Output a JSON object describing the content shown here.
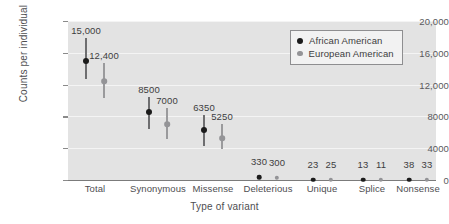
{
  "chart_data": {
    "type": "scatter",
    "title": "",
    "xlabel": "Type of variant",
    "ylabel": "Counts per individual",
    "ylim": [
      0,
      20000
    ],
    "yticks": [
      "0",
      "4000",
      "8000",
      "12,000",
      "16,000",
      "20,000"
    ],
    "ytick_values": [
      0,
      4000,
      8000,
      12000,
      16000,
      20000
    ],
    "grid": "horizontal",
    "legend_position": "top-right",
    "categories": [
      "Total",
      "Synonymous",
      "Missense",
      "Deleterious",
      "Unique",
      "Splice",
      "Nonsense"
    ],
    "series": [
      {
        "name": "African American",
        "color": "#1b1b1b",
        "values": [
          15000,
          8500,
          6350,
          330,
          23,
          13,
          38
        ],
        "labels": [
          "15,000",
          "8500",
          "6350",
          "330",
          "23",
          "13",
          "38"
        ],
        "err_low": [
          12700,
          6400,
          4300,
          120,
          5,
          3,
          10
        ],
        "err_high": [
          17800,
          10400,
          8200,
          600,
          45,
          25,
          70
        ]
      },
      {
        "name": "European American",
        "color": "#949497",
        "values": [
          12400,
          7000,
          5250,
          300,
          25,
          11,
          33
        ],
        "labels": [
          "12,400",
          "7000",
          "5250",
          "300",
          "25",
          "11",
          "33"
        ],
        "err_low": [
          10300,
          5200,
          3900,
          110,
          6,
          3,
          9
        ],
        "err_high": [
          14700,
          9000,
          7100,
          560,
          48,
          22,
          62
        ]
      }
    ]
  },
  "legend": {
    "entries": [
      {
        "label": "African American",
        "color": "#1b1b1b"
      },
      {
        "label": "European American",
        "color": "#949497"
      }
    ]
  }
}
